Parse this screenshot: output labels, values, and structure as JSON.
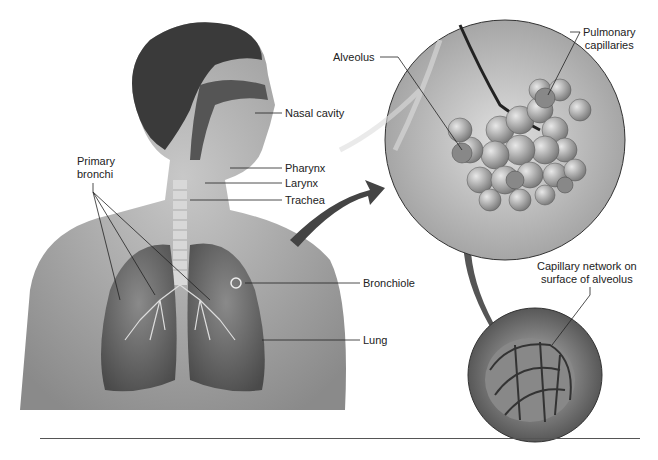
{
  "figure": {
    "labels": {
      "nasal_cavity": "Nasal cavity",
      "pharynx": "Pharynx",
      "larynx": "Larynx",
      "trachea": "Trachea",
      "primary_bronchi_1": "Primary",
      "primary_bronchi_2": "bronchi",
      "bronchiole": "Bronchiole",
      "lung": "Lung",
      "alveolus": "Alveolus",
      "pulmonary_capillaries_1": "Pulmonary",
      "pulmonary_capillaries_2": "capillaries",
      "capillary_network_1": "Capillary network on",
      "capillary_network_2": "surface of alveolus"
    }
  }
}
